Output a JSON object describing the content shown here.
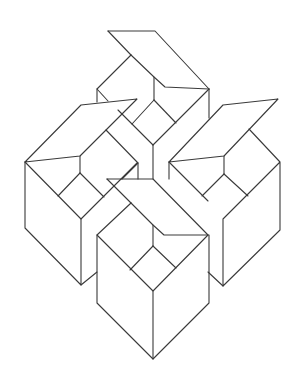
{
  "figure": {
    "title": "Four interlocking open boxes",
    "background": "#ffffff",
    "stroke_color": "#3a3a3a",
    "stroke_width": 1.1
  },
  "boxes": [
    {
      "name": "top-box",
      "paths": [
        "M108,31 L155,31 L209,89",
        "M108,31 L131,55",
        "M131,55 L97,89 L97,102",
        "M97,89 L108,101",
        "M154,77 L154,100",
        "M131,55 L154,77 L165,87 L209,89",
        "M154,100 L132,124",
        "M154,100 L176,123",
        "M118,110 L153,145",
        "M153,145 L209,89",
        "M209,89 L209,118",
        "M153,145 L153,179"
      ]
    },
    {
      "name": "left-box",
      "paths": [
        "M25,162 L81,105 L137,99 L80,156 L25,162",
        "M80,156 L80,173",
        "M25,162 L81,219 L137,163",
        "M80,173 L58,196",
        "M80,173 L104,197",
        "M25,162 L25,228 L81,285 L81,219",
        "M81,285 L97,272",
        "M106,130 L138,163 L138,179",
        "M122,179 L138,163"
      ]
    },
    {
      "name": "right-box",
      "paths": [
        "M169,162 L223,105 L278,99 L224,156 L169,162",
        "M224,156 L224,174",
        "M169,162 L208,201",
        "M224,174 L202,196",
        "M224,174 L248,196",
        "M249,129 L280,162 L223,219 L223,286 L280,230 L280,162",
        "M223,286 L208,272",
        "M169,162 L169,179"
      ]
    },
    {
      "name": "front-box",
      "paths": [
        "M107,179 L153,179 L208,235",
        "M107,179 L131,203",
        "M131,203 L97,235 L97,303 L153,359 L209,303 L209,235",
        "M153,225 L153,246",
        "M131,203 L153,225 L164,235 L208,235",
        "M153,246 L130,270",
        "M153,246 L176,268",
        "M97,235 L153,291 L208,235",
        "M153,291 L153,359"
      ]
    }
  ]
}
